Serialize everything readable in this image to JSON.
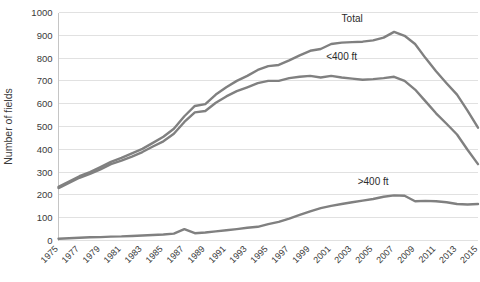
{
  "chart_data": {
    "type": "line",
    "title": "",
    "xlabel": "",
    "ylabel": "Number of fields",
    "ylim": [
      0,
      1000
    ],
    "ytick_step": 100,
    "yticks": [
      "0",
      "100",
      "200",
      "300",
      "400",
      "500",
      "600",
      "700",
      "800",
      "900",
      "1000"
    ],
    "grid": true,
    "legend_position": "inline-labels",
    "x": [
      1975,
      1976,
      1977,
      1978,
      1979,
      1980,
      1981,
      1982,
      1983,
      1984,
      1985,
      1986,
      1987,
      1988,
      1989,
      1990,
      1991,
      1992,
      1993,
      1994,
      1995,
      1996,
      1997,
      1998,
      1999,
      2000,
      2001,
      2002,
      2003,
      2004,
      2005,
      2006,
      2007,
      2008,
      2009,
      2010,
      2011,
      2012,
      2013,
      2014,
      2015
    ],
    "xticks": [
      "1975",
      "1977",
      "1979",
      "1981",
      "1983",
      "1985",
      "1987",
      "1989",
      "1991",
      "1993",
      "1995",
      "1997",
      "1999",
      "2001",
      "2003",
      "2005",
      "2007",
      "2009",
      "2011",
      "2013",
      "2015"
    ],
    "xlim": [
      1975,
      2015
    ],
    "series": [
      {
        "name": "Total",
        "label": "Total",
        "color": "#808080",
        "label_x": 2003,
        "label_y": 960,
        "values": [
          235,
          258,
          282,
          300,
          322,
          345,
          362,
          382,
          402,
          428,
          455,
          490,
          545,
          590,
          598,
          640,
          672,
          700,
          722,
          748,
          765,
          770,
          790,
          812,
          832,
          840,
          862,
          868,
          870,
          872,
          878,
          890,
          915,
          898,
          862,
          800,
          742,
          690,
          640,
          570,
          495
        ]
      },
      {
        "name": "<400 ft",
        "label": "<400 ft",
        "color": "#808080",
        "label_x": 2002,
        "label_y": 790,
        "values": [
          230,
          252,
          275,
          292,
          312,
          335,
          350,
          368,
          388,
          412,
          435,
          468,
          520,
          562,
          568,
          604,
          632,
          655,
          672,
          690,
          700,
          700,
          712,
          718,
          722,
          715,
          722,
          715,
          710,
          705,
          708,
          712,
          718,
          700,
          662,
          610,
          558,
          512,
          465,
          398,
          335
        ]
      },
      {
        "name": ">400 ft",
        "label": ">400 ft",
        "color": "#808080",
        "label_x": 2005,
        "label_y": 245,
        "values": [
          8,
          10,
          12,
          14,
          15,
          17,
          18,
          20,
          22,
          24,
          26,
          30,
          50,
          32,
          35,
          40,
          45,
          50,
          56,
          60,
          72,
          82,
          96,
          112,
          128,
          142,
          152,
          160,
          168,
          175,
          182,
          192,
          198,
          196,
          172,
          174,
          172,
          168,
          160,
          158,
          160
        ]
      }
    ]
  },
  "axis": {
    "y_title": "Number of fields"
  }
}
